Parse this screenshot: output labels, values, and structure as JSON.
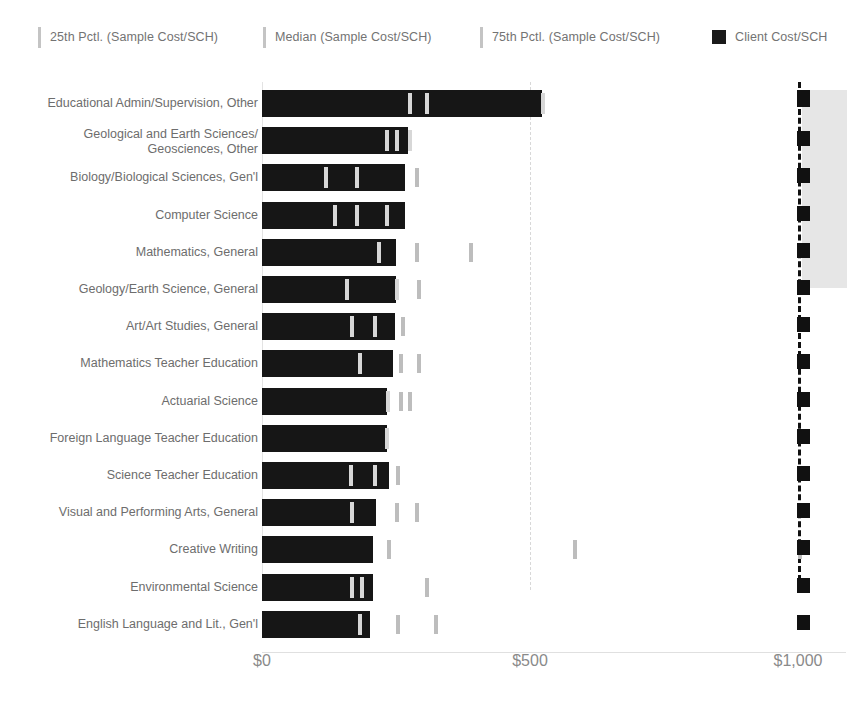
{
  "legend": {
    "items": [
      {
        "label": "25th Pctl. (Sample Cost/SCH)",
        "type": "bar-mark",
        "color": "#c4c4c4",
        "x": 38
      },
      {
        "label": "Median (Sample Cost/SCH)",
        "type": "bar-mark",
        "color": "#c4c4c4",
        "x": 263
      },
      {
        "label": "75th Pctl. (Sample Cost/SCH)",
        "type": "bar-mark",
        "color": "#c4c4c4",
        "x": 480
      },
      {
        "label": "Client Cost/SCH",
        "type": "box-mark",
        "color": "#1a1a1a",
        "x": 712
      }
    ]
  },
  "axis": {
    "ticks": [
      {
        "label": "$0",
        "value": 0
      },
      {
        "label": "$500",
        "value": 500
      },
      {
        "label": "$1,000",
        "value": 1000
      }
    ],
    "xmin": 0,
    "xmax": 1060
  },
  "chart_data": {
    "type": "bar",
    "title": "",
    "xlabel": "",
    "ylabel": "",
    "xlim": [
      0,
      1060
    ],
    "grid": true,
    "legend_position": "top",
    "series": [
      {
        "name": "Client Cost/SCH",
        "kind": "bar",
        "color": "#161616"
      },
      {
        "name": "25th Pctl. (Sample Cost/SCH)",
        "kind": "tick",
        "color": "#c4c4c4"
      },
      {
        "name": "Median (Sample Cost/SCH)",
        "kind": "tick",
        "color": "#c4c4c4"
      },
      {
        "name": "75th Pctl. (Sample Cost/SCH)",
        "kind": "tick",
        "color": "#c4c4c4"
      },
      {
        "name": "Client Cost/SCH (marker)",
        "kind": "marker",
        "color": "#111111"
      }
    ],
    "categories": [
      "Educational Admin/Supervision, Other",
      "Geological and Earth Sciences/\nGeosciences, Other",
      "Biology/Biological Sciences, Gen'l",
      "Computer Science",
      "Mathematics, General",
      "Geology/Earth Science, General",
      "Art/Art Studies, General",
      "Mathematics Teacher Education",
      "Actuarial Science",
      "Foreign Language Teacher Education",
      "Science Teacher Education",
      "Visual and Performing Arts, General",
      "Creative Writing",
      "Environmental Science",
      "English Language and Lit., Gen'l"
    ],
    "rows": [
      {
        "category": "Educational Admin/Supervision, Other",
        "client_cost": 522,
        "p25": 272,
        "median": 304,
        "p75": 520,
        "client_marker": 1010
      },
      {
        "category": "Geological and Earth Sciences/\nGeosciences, Other",
        "client_cost": 272,
        "p25": 229,
        "median": 248,
        "p75": 272,
        "client_marker": 1010
      },
      {
        "category": "Biology/Biological Sciences, Gen'l",
        "client_cost": 266,
        "p25": 115,
        "median": 174,
        "p75": 285,
        "client_marker": 1010
      },
      {
        "category": "Computer Science",
        "client_cost": 266,
        "p25": 133,
        "median": 174,
        "p75": 229,
        "client_marker": 1010
      },
      {
        "category": "Mathematics, General",
        "client_cost": 250,
        "p25": 215,
        "median": 285,
        "p75": 387,
        "client_marker": 1010
      },
      {
        "category": "Geology/Earth Science, General",
        "client_cost": 250,
        "p25": 155,
        "median": 248,
        "p75": 289,
        "client_marker": 1010
      },
      {
        "category": "Art/Art Studies, General",
        "client_cost": 248,
        "p25": 165,
        "median": 207,
        "p75": 260,
        "client_marker": 1010
      },
      {
        "category": "Mathematics Teacher Education",
        "client_cost": 244,
        "p25": 180,
        "median": 255,
        "p75": 289,
        "client_marker": 1010
      },
      {
        "category": "Actuarial Science",
        "client_cost": 233,
        "p25": 231,
        "median": 255,
        "p75": 272,
        "client_marker": 1010
      },
      {
        "category": "Foreign Language Teacher Education",
        "client_cost": 233,
        "p25": 229,
        "median": 229,
        "p75": 229,
        "client_marker": 1010
      },
      {
        "category": "Science Teacher Education",
        "client_cost": 237,
        "p25": 163,
        "median": 207,
        "p75": 250,
        "client_marker": 1010
      },
      {
        "category": "Visual and Performing Arts, General",
        "client_cost": 212,
        "p25": 165,
        "median": 248,
        "p75": 285,
        "client_marker": 1010
      },
      {
        "category": "Creative Writing",
        "client_cost": 207,
        "p25": 233,
        "median": 580,
        "p75": 1000,
        "client_marker": 1010
      },
      {
        "category": "Environmental Science",
        "client_cost": 207,
        "p25": 165,
        "median": 182,
        "p75": 304,
        "client_marker": 1010
      },
      {
        "category": "English Language and Lit., Gen'l",
        "client_cost": 202,
        "p25": 180,
        "median": 250,
        "p75": 320,
        "client_marker": 1010
      }
    ]
  },
  "highlight": {
    "left": 802,
    "top": 8,
    "width": 45,
    "height": 198,
    "color": "#e2e2e2"
  }
}
